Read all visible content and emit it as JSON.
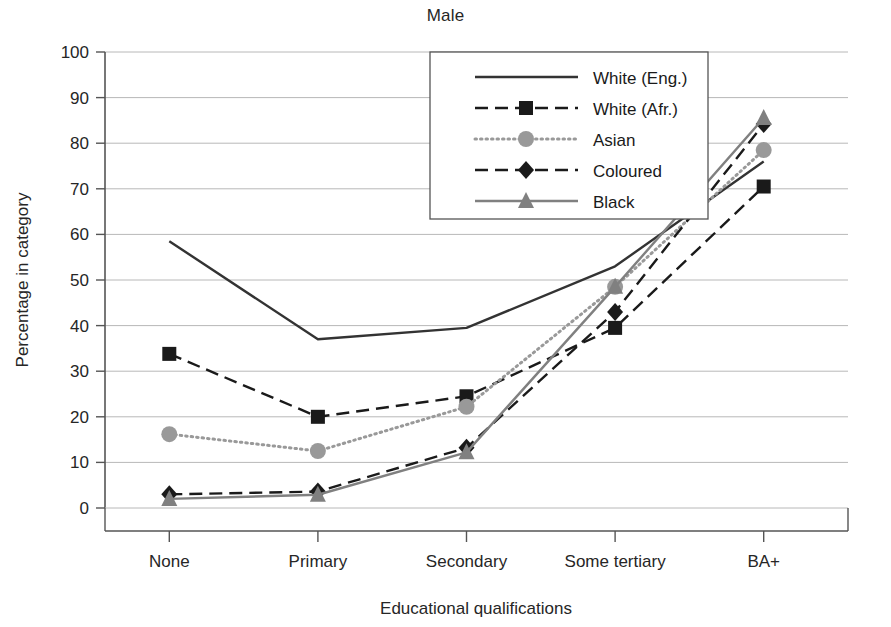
{
  "chart_data": {
    "type": "line",
    "title": "Male",
    "xlabel": "Educational qualifications",
    "ylabel": "Percentage in category",
    "categories": [
      "None",
      "Primary",
      "Secondary",
      "Some tertiary",
      "BA+"
    ],
    "ylim": [
      0,
      100
    ],
    "yticks": [
      0,
      10,
      20,
      30,
      40,
      50,
      60,
      70,
      80,
      90,
      100
    ],
    "grid": true,
    "legend_position": "top-center-right",
    "series": [
      {
        "name": "White (Eng.)",
        "values": [
          58.5,
          37.0,
          39.5,
          53.0,
          76.0
        ],
        "color": "#333333",
        "line_style": "solid",
        "marker": "none"
      },
      {
        "name": "White (Afr.)",
        "values": [
          33.8,
          20.0,
          24.5,
          39.5,
          70.5
        ],
        "color": "#1a1a1a",
        "line_style": "dashed",
        "marker": "square"
      },
      {
        "name": "Asian",
        "values": [
          16.2,
          12.5,
          22.2,
          48.5,
          78.5
        ],
        "color": "#999999",
        "line_style": "dotted",
        "marker": "circle"
      },
      {
        "name": "Coloured",
        "values": [
          3.0,
          3.6,
          13.2,
          43.0,
          84.2
        ],
        "color": "#1a1a1a",
        "line_style": "dashed",
        "marker": "diamond"
      },
      {
        "name": "Black",
        "values": [
          2.0,
          2.9,
          12.2,
          48.5,
          85.5
        ],
        "color": "#808080",
        "line_style": "solid",
        "marker": "triangle"
      }
    ]
  },
  "legend": {
    "entries": [
      "White (Eng.)",
      "White (Afr.)",
      "Asian",
      "Coloured",
      "Black"
    ]
  },
  "axes": {
    "y_tick_labels": [
      "0",
      "10",
      "20",
      "30",
      "40",
      "50",
      "60",
      "70",
      "80",
      "90",
      "100"
    ],
    "x_tick_labels": [
      "None",
      "Primary",
      "Secondary",
      "Some tertiary",
      "BA+"
    ]
  }
}
